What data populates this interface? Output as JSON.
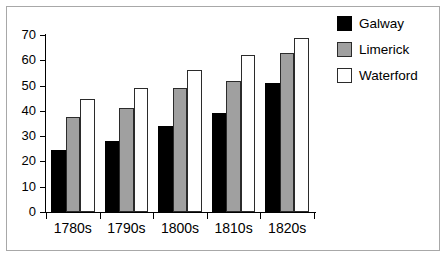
{
  "figure": {
    "background_color": "#ffffff",
    "frame_color": "#a8a8a8"
  },
  "legend": {
    "position": "top-right",
    "entries": [
      {
        "label": "Galway",
        "color": "#000000",
        "swatch_name": "legend-swatch-galway"
      },
      {
        "label": "Limerick",
        "color": "#a0a0a0",
        "swatch_name": "legend-swatch-limerick"
      },
      {
        "label": "Waterford",
        "color": "#ffffff",
        "swatch_name": "legend-swatch-waterford"
      }
    ]
  },
  "axes": {
    "y_ticks": [
      "0",
      "10",
      "20",
      "30",
      "40",
      "50",
      "60",
      "70"
    ],
    "x_ticks": [
      "1780s",
      "1790s",
      "1800s",
      "1810s",
      "1820s"
    ]
  },
  "chart_data": {
    "type": "bar",
    "title": "",
    "subtitle": "",
    "xlabel": "",
    "ylabel": "",
    "categories": [
      "1780s",
      "1790s",
      "1800s",
      "1810s",
      "1820s"
    ],
    "series": [
      {
        "name": "Galway",
        "color": "#000000",
        "values": [
          24.5,
          28,
          34,
          39,
          51
        ]
      },
      {
        "name": "Limerick",
        "color": "#a0a0a0",
        "values": [
          37.5,
          41,
          49,
          52,
          63
        ]
      },
      {
        "name": "Waterford",
        "color": "#ffffff",
        "values": [
          44.5,
          49,
          56,
          62,
          69
        ]
      }
    ],
    "ylim": [
      0,
      70
    ],
    "ytick_step": 10,
    "grid": false,
    "legend_position": "top-right",
    "grouped": true
  }
}
